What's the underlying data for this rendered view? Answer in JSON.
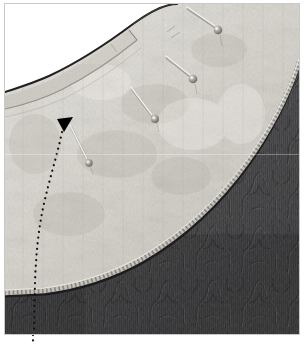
{
  "image": {
    "kind": "photograph",
    "subject": "sewing-construction-neckline-detail",
    "title": "Light textured yoke pinned to dark damask bodice at curved neckline",
    "width": 307,
    "height": 344,
    "background_color": "#ffffff",
    "frame": {
      "present": true,
      "border_color": "#c9c9c9",
      "border_width": 1,
      "inset_left": 4,
      "inset_top": 3,
      "width": 296,
      "height": 332
    }
  },
  "palette": {
    "paper_white": "#ffffff",
    "light_fabric_base": "#d9d6cf",
    "light_fabric_highlight": "#efeee9",
    "light_fabric_shadow": "#b6b2aa",
    "light_fabric_speckle": "#9d9992",
    "dark_fabric_base": "#4b4b4d",
    "dark_fabric_shadow": "#343437",
    "dark_fabric_damask": "#2c2c2e",
    "dark_fabric_highlight": "#616164",
    "seam_line": "#1a1a1a",
    "serged_edge": "#bdbab3",
    "pin_shaft": "#f2f0ec",
    "pin_shaft_shadow": "#6d6a66",
    "pin_head": "#8f8c87",
    "pin_head_highlight": "#e8e6e2",
    "marker_black": "#000000",
    "frame_grey": "#c9c9c9"
  },
  "regions": [
    {
      "id": "background-white",
      "label": "White background above neckline",
      "color": "#ffffff",
      "description": "Plain white paper / backdrop visible in the upper-left corner above the curved neckline edge."
    },
    {
      "id": "light-yoke-fabric",
      "label": "Light heathered fabric yoke piece",
      "color": "#d9d6cf",
      "description": "Large pale grey-beige mottled woven panel occupying the upper-left two thirds, curving to a quarter-round lower-right boundary."
    },
    {
      "id": "neckline-facing-strip",
      "label": "Neckline facing / binding strip",
      "color": "#cfccc5",
      "description": "Narrow band of the same light fabric folded along the top neckline edge, finishing at a squared end near the centre-left."
    },
    {
      "id": "dark-damask-fabric",
      "label": "Dark damask bodice fabric",
      "color": "#4b4b4d",
      "description": "Charcoal grey fabric with a tonal scrolling damask/brocade motif filling the lower-right region beneath the curved serged edge."
    },
    {
      "id": "serged-curve-edge",
      "label": "Serged / overlocked curved seam edge",
      "color": "#bdbab3",
      "description": "Zigzag overlock stitching running the full length of the curve where the light yoke meets the dark fabric."
    }
  ],
  "markers": {
    "arrow": {
      "id": "black-triangle-marker",
      "label": "Black downward triangle pointer",
      "color": "#000000",
      "x": 62,
      "y": 118,
      "size": 11,
      "direction": "down",
      "description": "Solid black arrowhead pointing down, placed just below the facing strip."
    },
    "dotted_guides": [
      {
        "id": "dotted-guide-left",
        "label": "Dotted annotation guideline (centre front)",
        "color": "#151515",
        "style": "dotted",
        "description": "Curved dotted line descending from the arrowhead, sweeping left then straight down through the dark fabric and continuing below the photo frame."
      },
      {
        "id": "dotted-guide-tail",
        "label": "Dotted guideline continuation below frame",
        "color": "#151515",
        "style": "dotted",
        "description": "Short dotted segment continuing beneath the bottom frame border at the lower-left."
      }
    ]
  },
  "pins": {
    "count": 4,
    "label": "Straight dressmaker pins holding the yoke in place",
    "items": [
      {
        "id": "pin-1",
        "label": "Pin 1 (upper right)",
        "shaft_start_x": 190,
        "shaft_start_y": 7,
        "head_x": 220,
        "head_y": 27,
        "head_radius": 4.2,
        "angle_deg": 34
      },
      {
        "id": "pin-2",
        "label": "Pin 2 (right of centre)",
        "shaft_start_x": 168,
        "shaft_start_y": 56,
        "head_x": 195,
        "head_y": 76,
        "head_radius": 4.2,
        "angle_deg": 36
      },
      {
        "id": "pin-3",
        "label": "Pin 3 (centre)",
        "shaft_start_x": 132,
        "shaft_start_y": 87,
        "head_x": 158,
        "head_y": 118,
        "head_radius": 3.9,
        "angle_deg": 50
      },
      {
        "id": "pin-4",
        "label": "Pin 4 (lower left)",
        "shaft_start_x": 68,
        "shaft_start_y": 124,
        "head_x": 90,
        "head_y": 163,
        "head_radius": 3.6,
        "angle_deg": 61
      }
    ]
  },
  "edges": {
    "neckline": {
      "id": "neckline-curve",
      "label": "Upper neckline curve",
      "color": "#1f1f1f",
      "description": "Dark inked curve sweeping from the left frame edge up to the right, separating white backdrop from the light fabric."
    },
    "yoke_seam": {
      "id": "yoke-to-bodice-seam",
      "label": "Curved yoke-to-bodice seam",
      "color": "#2a2a2a",
      "description": "Long quarter-circle seam from the upper-right frame edge down to the lower-left frame edge where light fabric meets dark fabric."
    }
  },
  "texture_notes": {
    "light_fabric": "Heathered / speckled woven weave with faint vertical slub streaks and soft grey mottling.",
    "dark_fabric": "Matte charcoal ground with a lighter tonal scrolling floral damask repeat and fine vertical ribbing.",
    "scan_artifacts": "Faint horizontal scan banding across the midline; mild JPEG softness throughout."
  }
}
